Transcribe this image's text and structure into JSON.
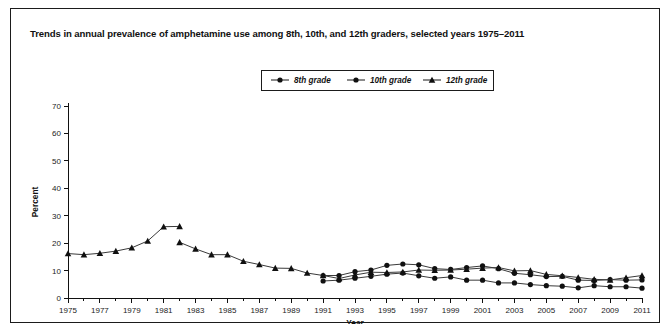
{
  "figure": {
    "title": "Trends in annual prevalence of amphetamine use among 8th, 10th, and 12th graders, selected years 1975–2011"
  },
  "chart_data": {
    "type": "line",
    "title": "Trends in annual prevalence of amphetamine use among 8th, 10th, and 12th graders, selected years 1975–2011",
    "xlabel": "Year",
    "ylabel": "Percent",
    "xlim": [
      1975,
      2011
    ],
    "ylim": [
      0,
      70
    ],
    "ytick_step": 10,
    "yticks": [
      0,
      10,
      20,
      30,
      40,
      50,
      60,
      70
    ],
    "xticks": [
      1975,
      1977,
      1979,
      1981,
      1983,
      1985,
      1987,
      1989,
      1991,
      1993,
      1995,
      1997,
      1999,
      2001,
      2003,
      2005,
      2007,
      2009,
      2011
    ],
    "xtick_minor_step": 1,
    "grid": false,
    "legend_position": "top-center",
    "series": [
      {
        "name": "8th grade",
        "marker": "circle",
        "x": [
          1991,
          1992,
          1993,
          1994,
          1995,
          1996,
          1997,
          1998,
          1999,
          2000,
          2001,
          2002,
          2003,
          2004,
          2005,
          2006,
          2007,
          2008,
          2009,
          2010,
          2011
        ],
        "values": [
          6.2,
          6.5,
          7.2,
          7.9,
          8.7,
          9.1,
          8.1,
          7.2,
          7.7,
          6.5,
          6.5,
          5.5,
          5.5,
          4.9,
          4.5,
          4.3,
          3.7,
          4.5,
          4.1,
          4.1,
          3.6
        ]
      },
      {
        "name": "10th grade",
        "marker": "circle",
        "x": [
          1991,
          1992,
          1993,
          1994,
          1995,
          1996,
          1997,
          1998,
          1999,
          2000,
          2001,
          2002,
          2003,
          2004,
          2005,
          2006,
          2007,
          2008,
          2009,
          2010,
          2011
        ],
        "values": [
          8.2,
          8.2,
          9.6,
          10.2,
          11.9,
          12.4,
          12.1,
          10.7,
          10.4,
          11.1,
          11.7,
          10.7,
          9.0,
          8.5,
          7.8,
          7.9,
          6.5,
          6.4,
          6.7,
          6.5,
          6.6
        ]
      },
      {
        "name": "12th grade",
        "marker": "triangle",
        "segments": [
          {
            "x": [
              1975,
              1976,
              1977,
              1978,
              1979,
              1980,
              1981,
              1982
            ],
            "values": [
              16.2,
              15.8,
              16.3,
              17.1,
              18.3,
              20.8,
              26.0,
              26.1
            ]
          },
          {
            "x": [
              1982,
              1983,
              1984,
              1985,
              1986,
              1987,
              1988,
              1989,
              1990,
              1991,
              1992,
              1993,
              1994,
              1995,
              1996,
              1997,
              1998,
              1999,
              2000,
              2001,
              2002,
              2003,
              2004,
              2005,
              2006,
              2007,
              2008,
              2009,
              2010,
              2011
            ],
            "values": [
              20.3,
              17.9,
              15.8,
              15.8,
              13.4,
              12.2,
              10.9,
              10.8,
              9.1,
              8.2,
              7.1,
              8.4,
              9.4,
              9.3,
              9.5,
              10.2,
              10.1,
              10.2,
              10.5,
              10.9,
              11.1,
              9.9,
              10.0,
              8.6,
              8.1,
              7.5,
              6.8,
              6.6,
              7.4,
              8.2
            ]
          }
        ]
      }
    ]
  }
}
